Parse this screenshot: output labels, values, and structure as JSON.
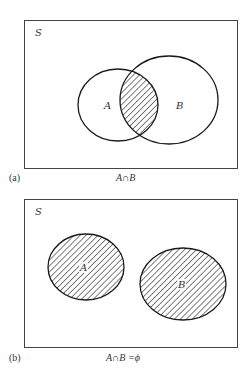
{
  "panels": [
    {
      "id": "a",
      "tag": "(a)",
      "universe_label": "S",
      "caption": "A∩B",
      "set_a_label": "A",
      "set_b_label": "B",
      "shaded": "intersection"
    },
    {
      "id": "b",
      "tag": "(b)",
      "universe_label": "S",
      "caption": "A∩B =ϕ",
      "set_a_label": "A",
      "set_b_label": "B",
      "shaded": "both sets (disjoint)"
    }
  ],
  "colors": {
    "stroke": "#1a1a1a",
    "frame": "#444444",
    "background": "#ffffff"
  }
}
